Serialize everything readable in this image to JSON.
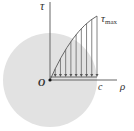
{
  "diagram": {
    "labels": {
      "tau_axis": "τ",
      "tau_max": "τ",
      "tau_max_sub": "max",
      "origin": "O",
      "c": "c",
      "rho_axis": "ρ"
    },
    "arrow_count": 9,
    "colors": {
      "disk_fill": "#e2e2e2",
      "line": "#666666",
      "text": "#333333"
    }
  }
}
